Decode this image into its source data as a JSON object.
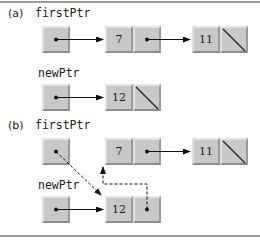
{
  "diagram": {
    "type": "linked-list-insert-at-front",
    "panel_a": {
      "tag": "(a)",
      "firstPtr_label": "firstPtr",
      "newPtr_label": "newPtr",
      "list_nodes": [
        {
          "value": "7",
          "next": "pointer"
        },
        {
          "value": "11",
          "next": "null"
        }
      ],
      "new_node": {
        "value": "12",
        "next": "null"
      }
    },
    "panel_b": {
      "tag": "(b)",
      "firstPtr_label": "firstPtr",
      "newPtr_label": "newPtr",
      "list_nodes": [
        {
          "value": "7",
          "next": "pointer"
        },
        {
          "value": "11",
          "next": "null"
        }
      ],
      "new_node": {
        "value": "12",
        "next": "pointer-to-7 (dashed)"
      },
      "firstPtr_target": "12 (dashed)"
    },
    "colors": {
      "box_fill": "#c8c8c8",
      "arrow": "#111111",
      "rule": "#9a9a9a"
    }
  }
}
